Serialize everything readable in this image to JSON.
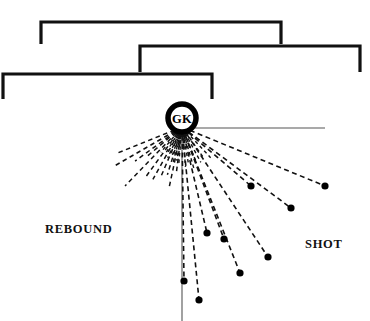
{
  "canvas": {
    "width": 370,
    "height": 321,
    "background": "#ffffff"
  },
  "colors": {
    "stroke": "#111111",
    "thin_stroke": "#555555",
    "dot": "#000000",
    "text": "#111111"
  },
  "labels": {
    "rebound": "REBOUND",
    "shot": "SHOT",
    "goalkeeper": "GK"
  },
  "chart_data": {
    "type": "scatter",
    "title": "",
    "xlabel": "",
    "ylabel": "",
    "origin": {
      "x": 182,
      "y": 127,
      "name": "goalkeeper-position"
    },
    "goal_frames": [
      {
        "name": "outer-frame",
        "x1": 41,
        "y1": 22,
        "x2": 281,
        "y2": 22,
        "post_depth": 22
      },
      {
        "name": "middle-frame",
        "x1": 140,
        "y1": 46,
        "x2": 360,
        "y2": 46,
        "post_depth": 26
      },
      {
        "name": "inner-frame",
        "x1": 3,
        "y1": 74,
        "x2": 212,
        "y2": 74,
        "post_depth": 25
      }
    ],
    "reference_lines": [
      {
        "name": "horizontal-axis",
        "x1": 192,
        "y1": 128,
        "x2": 325,
        "y2": 128
      },
      {
        "name": "vertical-axis",
        "x1": 182,
        "y1": 128,
        "x2": 182,
        "y2": 321
      }
    ],
    "shot_rays": [
      {
        "x": 325,
        "y": 186,
        "angle_deg": 22.9,
        "length": 155
      },
      {
        "x": 291,
        "y": 208,
        "angle_deg": 34.5,
        "length": 133
      },
      {
        "x": 251,
        "y": 186,
        "angle_deg": 41.3,
        "length": 91
      },
      {
        "x": 268,
        "y": 257,
        "angle_deg": 57.7,
        "length": 153
      },
      {
        "x": 240,
        "y": 273,
        "angle_deg": 67.4,
        "length": 158
      },
      {
        "x": 207,
        "y": 233,
        "angle_deg": 76.7,
        "length": 109
      },
      {
        "x": 199,
        "y": 300,
        "angle_deg": 83.8,
        "length": 174
      },
      {
        "x": 224,
        "y": 239,
        "angle_deg": 69.6,
        "length": 118
      },
      {
        "x": 184,
        "y": 281,
        "angle_deg": 89.3,
        "length": 154
      }
    ],
    "rebound_rays": [
      {
        "angle_deg": 150.0,
        "length": 78
      },
      {
        "angle_deg": 158.0,
        "length": 70
      },
      {
        "angle_deg": 134.0,
        "length": 82
      },
      {
        "angle_deg": 126.0,
        "length": 64
      },
      {
        "angle_deg": 119.0,
        "length": 60
      },
      {
        "angle_deg": 113.0,
        "length": 56
      },
      {
        "angle_deg": 107.0,
        "length": 50
      },
      {
        "angle_deg": 102.0,
        "length": 62
      },
      {
        "angle_deg": 97.0,
        "length": 46
      },
      {
        "angle_deg": 144.0,
        "length": 58
      },
      {
        "angle_deg": 140.0,
        "length": 48
      }
    ],
    "short_inner_rays": [
      {
        "angle_deg": 95.0,
        "length": 38
      },
      {
        "angle_deg": 99.0,
        "length": 34
      },
      {
        "angle_deg": 104.0,
        "length": 36
      },
      {
        "angle_deg": 109.0,
        "length": 32
      },
      {
        "angle_deg": 115.0,
        "length": 34
      },
      {
        "angle_deg": 122.0,
        "length": 30
      },
      {
        "angle_deg": 130.0,
        "length": 33
      },
      {
        "angle_deg": 85.0,
        "length": 40
      },
      {
        "angle_deg": 80.0,
        "length": 36
      },
      {
        "angle_deg": 74.0,
        "length": 44
      },
      {
        "angle_deg": 68.0,
        "length": 38
      },
      {
        "angle_deg": 62.0,
        "length": 40
      },
      {
        "angle_deg": 55.0,
        "length": 36
      },
      {
        "angle_deg": 47.0,
        "length": 42
      }
    ],
    "goalkeeper_marker": {
      "cx": 182,
      "cy": 118,
      "r_outer": 16,
      "r_inner": 12
    }
  }
}
